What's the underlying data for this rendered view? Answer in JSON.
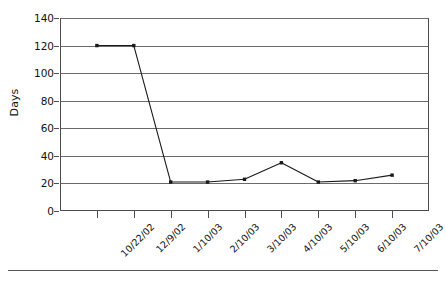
{
  "chart_data": {
    "type": "line",
    "title": "",
    "xlabel": "",
    "ylabel": "Days",
    "categories": [
      "10/22/02",
      "12/9/02",
      "1/10/03",
      "2/10/03",
      "3/10/03",
      "4/10/03",
      "5/10/03",
      "6/10/03",
      "7/10/03"
    ],
    "values": [
      120,
      120,
      21,
      21,
      23,
      35,
      21,
      22,
      26
    ],
    "series": [
      {
        "name": "Days",
        "values": [
          120,
          120,
          21,
          21,
          23,
          35,
          21,
          22,
          26
        ]
      }
    ],
    "ylim": [
      0,
      140
    ],
    "yticks": [
      0,
      20,
      40,
      60,
      80,
      100,
      120,
      140
    ],
    "ytick_labels": [
      "0",
      "20",
      "40",
      "60",
      "80",
      "100",
      "120",
      "140"
    ],
    "grid": "horizontal",
    "legend": "none",
    "marker": "filled-square",
    "line_color": "#1a1a1a",
    "marker_color": "#1a1a1a",
    "grid_color": "#6b6b6b",
    "axis_color": "#4d4d4d",
    "background_color": "#ffffff",
    "xtick_label_rotation": -45
  }
}
